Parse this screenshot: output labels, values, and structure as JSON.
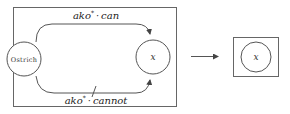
{
  "diagram": {
    "left_panel": {
      "nodes": {
        "source": {
          "label": "Ostrich"
        },
        "target": {
          "label": "x"
        }
      },
      "edges": {
        "top": {
          "label_prefix": "ako",
          "label_star": "*",
          "label_dot": "·",
          "label_suffix": "can",
          "negated": false
        },
        "bottom": {
          "label_prefix": "ako",
          "label_star": "*",
          "label_dot": "·",
          "label_suffix": "cannot",
          "negated": true
        }
      }
    },
    "transition_arrow": {
      "direction": "right"
    },
    "right_panel": {
      "nodes": {
        "result": {
          "label": "x"
        }
      }
    }
  }
}
